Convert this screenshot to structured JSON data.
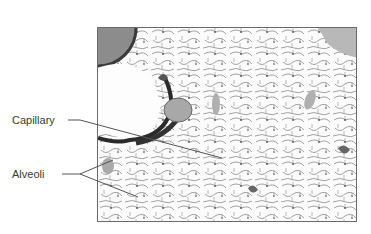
{
  "figure": {
    "type": "lung tissue micrograph",
    "labels": [
      {
        "text": "Capillary",
        "x": 12,
        "y": 114
      },
      {
        "text": "Alveoli",
        "x": 12,
        "y": 168
      }
    ]
  },
  "colors": {
    "tissue_dark": "#2a2a2a",
    "tissue_mid": "#7a7a7a",
    "tissue_light": "#bdbdbd",
    "vessel_fill": "#a8a8a8",
    "leader_line": "#555555",
    "frame": "#6a6a6a"
  }
}
